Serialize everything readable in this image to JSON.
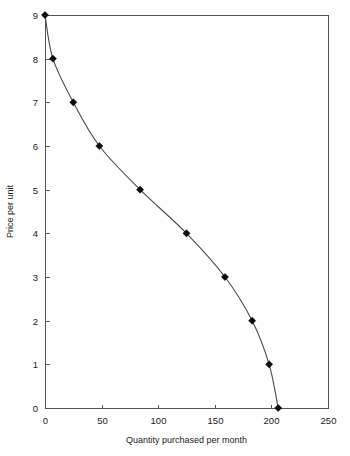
{
  "chart_data": {
    "type": "line",
    "title": "",
    "subtitle": "",
    "xlabel": "Quantity purchased per month",
    "ylabel": "Price per unit",
    "xlim": [
      0,
      250
    ],
    "ylim": [
      0,
      9
    ],
    "xticks": [
      0,
      50,
      100,
      150,
      200,
      250
    ],
    "yticks": [
      0,
      1,
      2,
      3,
      4,
      5,
      6,
      7,
      8,
      9
    ],
    "xtick_labels": [
      "0",
      "50",
      "100",
      "150",
      "200",
      "250"
    ],
    "ytick_labels": [
      "0",
      "1",
      "2",
      "3",
      "4",
      "5",
      "6",
      "7",
      "8",
      "9"
    ],
    "grid": false,
    "legend": null,
    "legend_position": "none",
    "marker": "diamond",
    "line_color": "#4a4a4a",
    "marker_color": "#0a0a0a",
    "background_color": "#ffffff",
    "frame_color": "#555555",
    "series": [
      {
        "name": "Demand",
        "x": [
          0,
          7,
          25,
          48,
          84,
          125,
          159,
          183,
          198,
          206
        ],
        "y": [
          9,
          8,
          7,
          6,
          5,
          4,
          3,
          2,
          1,
          0
        ]
      }
    ],
    "points": [
      {
        "x": 0,
        "y": 9
      },
      {
        "x": 7,
        "y": 8
      },
      {
        "x": 25,
        "y": 7
      },
      {
        "x": 48,
        "y": 6
      },
      {
        "x": 84,
        "y": 5
      },
      {
        "x": 125,
        "y": 4
      },
      {
        "x": 159,
        "y": 3
      },
      {
        "x": 183,
        "y": 2
      },
      {
        "x": 198,
        "y": 1
      },
      {
        "x": 206,
        "y": 0
      }
    ]
  },
  "layout": {
    "plot_left": 45,
    "plot_right": 328,
    "plot_top": 15,
    "plot_bottom": 408,
    "tick_len": 4,
    "xlabel_y": 443,
    "ylabel_x": 13,
    "xtick_label_y": 424,
    "ytick_label_dx": -7
  }
}
